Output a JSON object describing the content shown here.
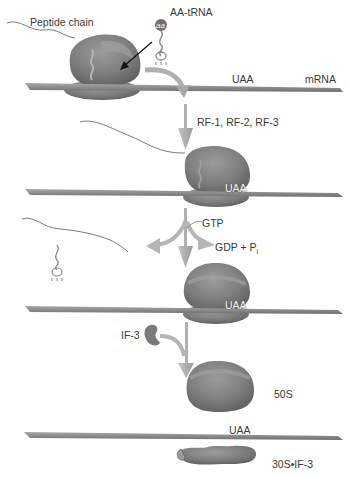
{
  "diagram": {
    "stage1": {
      "peptide_label": "Peptide chain",
      "trna_label": "AA-tRNA",
      "trna_aa": "aa",
      "codon_label": "UAA",
      "mrna_label": "mRNA"
    },
    "stage2": {
      "factors_label": "RF-1, RF-2, RF-3",
      "codon_label": "UAA"
    },
    "stage3": {
      "gtp_label": "GTP",
      "gdp_label": "GDP + P",
      "gdp_sub": "i",
      "codon_label": "UAA"
    },
    "stage4": {
      "if3_label": "IF-3",
      "large_subunit_label": "50S",
      "codon_label": "UAA",
      "small_subunit_label": "30S•IF-3"
    },
    "colors": {
      "ribosome": "#7a7a7a",
      "ribosome_light": "#9a9a9a",
      "mrna": "#8e8e8e",
      "arrow": "#b5b5b5",
      "text": "#3a3a3a"
    }
  }
}
